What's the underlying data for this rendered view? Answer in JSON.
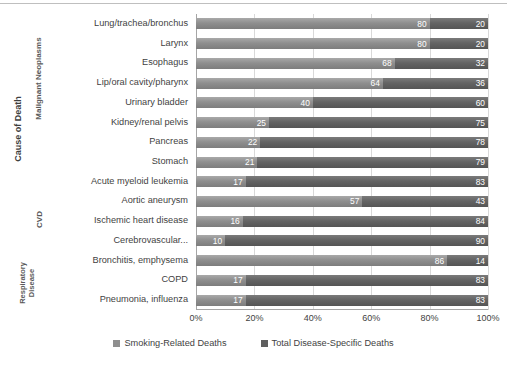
{
  "chart_data": {
    "type": "bar",
    "orientation": "horizontal",
    "stacked": true,
    "normalized": true,
    "title": "",
    "xlabel": "",
    "ylabel": "Cause of Death",
    "xlim": [
      0,
      100
    ],
    "x_tick_labels": [
      "0%",
      "20%",
      "40%",
      "60%",
      "80%",
      "100%"
    ],
    "x_tick_values": [
      0,
      20,
      40,
      60,
      80,
      100
    ],
    "grid": "vertical",
    "legend_position": "bottom",
    "categories": [
      "Lung/trachea/bronchus",
      "Larynx",
      "Esophagus",
      "Lip/oral cavity/pharynx",
      "Urinary bladder",
      "Kidney/renal pelvis",
      "Pancreas",
      "Stomach",
      "Acute myeloid leukemia",
      "Aortic aneurysm",
      "Ischemic heart disease",
      "Cerebrovascular...",
      "Bronchitis, emphysema",
      "COPD",
      "Pneumonia, influenza"
    ],
    "category_groups": [
      {
        "label": "Malignant Neoplasms",
        "start_index": 0,
        "end_index": 8
      },
      {
        "label": "CVD",
        "start_index": 9,
        "end_index": 11
      },
      {
        "label": "Respiratory Disease",
        "start_index": 12,
        "end_index": 14
      }
    ],
    "series": [
      {
        "name": "Smoking-Related Deaths",
        "color": "#8f8f8f",
        "values": [
          80,
          80,
          68,
          64,
          40,
          25,
          22,
          21,
          17,
          57,
          16,
          10,
          86,
          17,
          17
        ]
      },
      {
        "name": "Total Disease-Specific Deaths",
        "color": "#5f5f5f",
        "values": [
          20,
          20,
          32,
          36,
          60,
          75,
          78,
          79,
          83,
          43,
          84,
          90,
          14,
          83,
          83
        ]
      }
    ]
  },
  "legend": {
    "items": [
      {
        "label": "Smoking-Related Deaths",
        "swatch": "sw-a"
      },
      {
        "label": "Total Disease-Specific Deaths",
        "swatch": "sw-b"
      }
    ]
  }
}
